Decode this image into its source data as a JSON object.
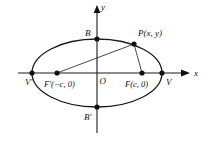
{
  "figure": {
    "kind": "ellipse-focal-definition-diagram",
    "colors": {
      "stroke": "#1a1a1a",
      "point": "#111111",
      "background": "#ffffff"
    },
    "axes": {
      "x_label": "x",
      "y_label": "y",
      "origin_label": "O"
    },
    "labels": {
      "vertex_left": "V′",
      "vertex_right": "V",
      "covertex_top": "B",
      "covertex_bottom": "B′",
      "focus_left": "F′(−c, 0)",
      "focus_right": "F(c, 0)",
      "point_on_curve": "P(x, y)"
    },
    "geometry": {
      "center": {
        "x": 97,
        "y": 73
      },
      "semi_major_axis": 65,
      "semi_minor_axis": 34,
      "focus_left_x": 57,
      "focus_right_x": 142,
      "vertex_left_x": 32,
      "vertex_right_x": 162,
      "covertex_top_y": 39,
      "covertex_bottom_y": 107,
      "point_p": {
        "x": 134,
        "y": 44
      }
    }
  }
}
